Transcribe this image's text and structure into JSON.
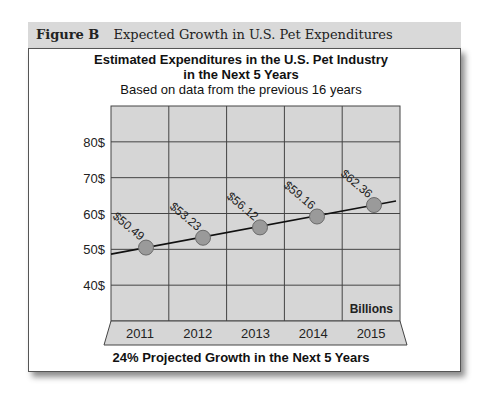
{
  "figure": {
    "id": "Figure B",
    "caption": "Expected Growth in U.S. Pet Expenditures"
  },
  "chart_data": {
    "type": "line",
    "title_line1": "Estimated Expenditures in the U.S. Pet Industry",
    "title_line2": "in the Next 5 Years",
    "subtitle": "Based on data from the previous 16 years",
    "categories": [
      "2011",
      "2012",
      "2013",
      "2014",
      "2015"
    ],
    "values": [
      50.49,
      53.23,
      56.12,
      59.16,
      62.36
    ],
    "data_labels": [
      "$50.49",
      "$53.23",
      "$56.12",
      "$59.16",
      "$62.36"
    ],
    "y_tick_labels": [
      "40$",
      "50$",
      "60$",
      "70$",
      "80$"
    ],
    "y_ticks": [
      40,
      50,
      60,
      70,
      80
    ],
    "ylim": [
      30,
      90
    ],
    "unit_label": "Billions",
    "xlabel": "24% Projected Growth in the Next 5 Years",
    "ylabel": "",
    "grid": true,
    "legend": null,
    "trend_line": true,
    "colors": {
      "plot_background": "#d6d6d6",
      "grid_lines": "#444444",
      "marker_fill": "#9a9a9a",
      "marker_stroke": "#6a6a6a",
      "line": "#111111",
      "header_band": "#d9d9d9"
    }
  }
}
